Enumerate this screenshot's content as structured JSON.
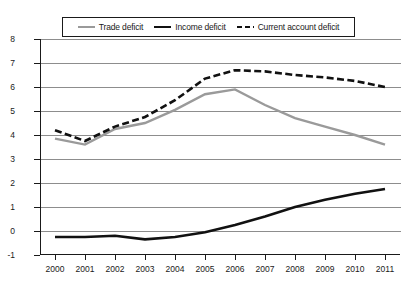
{
  "chart_data": {
    "type": "line",
    "title": "",
    "xlabel": "",
    "ylabel": "",
    "categories": [
      "2000",
      "2001",
      "2002",
      "2003",
      "2004",
      "2005",
      "2006",
      "2007",
      "2008",
      "2009",
      "2010",
      "2011"
    ],
    "x": [
      2000,
      2001,
      2002,
      2003,
      2004,
      2005,
      2006,
      2007,
      2008,
      2009,
      2010,
      2011
    ],
    "ylim": [
      -1,
      8
    ],
    "yticks": [
      -1,
      0,
      1,
      2,
      3,
      4,
      5,
      6,
      7,
      8
    ],
    "grid": true,
    "legend_position": "top-center",
    "series": [
      {
        "name": "Trade deficit",
        "color": "#9a9a9a",
        "style": "solid",
        "values": [
          3.85,
          3.6,
          4.25,
          4.5,
          5.05,
          5.7,
          5.9,
          5.25,
          4.7,
          4.35,
          4.0,
          3.6
        ]
      },
      {
        "name": "Income deficit",
        "color": "#111111",
        "style": "solid",
        "values": [
          -0.25,
          -0.25,
          -0.2,
          -0.35,
          -0.25,
          -0.05,
          0.25,
          0.6,
          1.0,
          1.3,
          1.55,
          1.75
        ]
      },
      {
        "name": "Current account deficit",
        "color": "#111111",
        "style": "dashed",
        "values": [
          4.2,
          3.75,
          4.35,
          4.75,
          5.45,
          6.35,
          6.7,
          6.65,
          6.5,
          6.4,
          6.25,
          6.0
        ]
      }
    ]
  },
  "legend": {
    "items": [
      {
        "label": "Trade deficit",
        "swatch": "trade-line-swatch"
      },
      {
        "label": "Income deficit",
        "swatch": "income-line-swatch"
      },
      {
        "label": "Current account deficit",
        "swatch": "current-account-line-swatch"
      }
    ]
  },
  "axes": {
    "y_tick_labels": [
      "8",
      "7",
      "6",
      "5",
      "4",
      "3",
      "2",
      "1",
      "0",
      "-1"
    ],
    "x_tick_labels": [
      "2000",
      "2001",
      "2002",
      "2003",
      "2004",
      "2005",
      "2006",
      "2007",
      "2008",
      "2009",
      "2010",
      "2011"
    ]
  }
}
